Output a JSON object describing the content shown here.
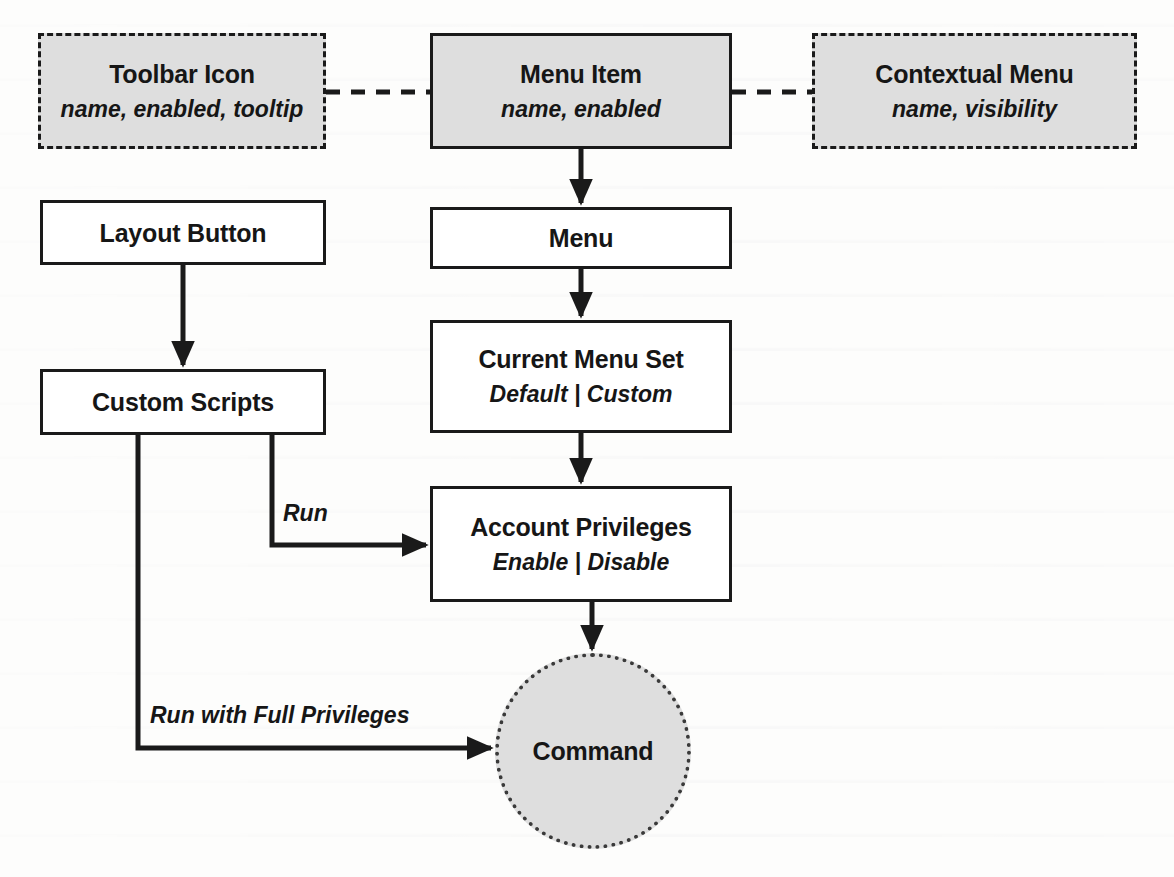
{
  "diagram": {
    "colors": {
      "ink": "#1a1a1a",
      "shaded_fill": "#dedede",
      "plain_fill": "#ffffff",
      "page": "#fdfdfc"
    },
    "nodes": [
      {
        "id": "toolbar-icon",
        "title": "Toolbar Icon",
        "sub": "name, enabled, tooltip",
        "shape": "rect",
        "border": "dashed",
        "fill": "shaded",
        "x": 38,
        "y": 33,
        "w": 288,
        "h": 116
      },
      {
        "id": "menu-item",
        "title": "Menu Item",
        "sub": "name, enabled",
        "shape": "rect",
        "border": "solid",
        "fill": "shaded",
        "x": 430,
        "y": 33,
        "w": 302,
        "h": 116
      },
      {
        "id": "contextual-menu",
        "title": "Contextual Menu",
        "sub": "name, visibility",
        "shape": "rect",
        "border": "dashed",
        "fill": "shaded",
        "x": 812,
        "y": 33,
        "w": 325,
        "h": 116
      },
      {
        "id": "layout-button",
        "title": "Layout Button",
        "sub": "",
        "shape": "rect",
        "border": "solid",
        "fill": "plain",
        "x": 40,
        "y": 200,
        "w": 286,
        "h": 65
      },
      {
        "id": "menu",
        "title": "Menu",
        "sub": "",
        "shape": "rect",
        "border": "solid",
        "fill": "plain",
        "x": 430,
        "y": 207,
        "w": 302,
        "h": 62
      },
      {
        "id": "custom-scripts",
        "title": "Custom Scripts",
        "sub": "",
        "shape": "rect",
        "border": "solid",
        "fill": "plain",
        "x": 40,
        "y": 369,
        "w": 286,
        "h": 66
      },
      {
        "id": "current-menu-set",
        "title": "Current Menu Set",
        "sub": "Default | Custom",
        "shape": "rect",
        "border": "solid",
        "fill": "plain",
        "x": 430,
        "y": 320,
        "w": 302,
        "h": 113
      },
      {
        "id": "account-privileges",
        "title": "Account Privileges",
        "sub": "Enable | Disable",
        "shape": "rect",
        "border": "solid",
        "fill": "plain",
        "x": 430,
        "y": 486,
        "w": 302,
        "h": 116
      },
      {
        "id": "command",
        "title": "Command",
        "sub": "",
        "shape": "circle",
        "border": "dotted",
        "fill": "shaded",
        "x": 495,
        "y": 653,
        "w": 196,
        "h": 196
      }
    ],
    "edges": [
      {
        "id": "toolbar-icon-to-menu-item",
        "from": "toolbar-icon",
        "to": "menu-item",
        "style": "dashed",
        "arrow": "none",
        "label": ""
      },
      {
        "id": "menu-item-to-contextual-menu",
        "from": "menu-item",
        "to": "contextual-menu",
        "style": "dashed",
        "arrow": "none",
        "label": ""
      },
      {
        "id": "menu-item-to-menu",
        "from": "menu-item",
        "to": "menu",
        "style": "solid",
        "arrow": "end",
        "label": ""
      },
      {
        "id": "menu-to-current-menu-set",
        "from": "menu",
        "to": "current-menu-set",
        "style": "solid",
        "arrow": "end",
        "label": ""
      },
      {
        "id": "current-menu-set-to-account-privileges",
        "from": "current-menu-set",
        "to": "account-privileges",
        "style": "solid",
        "arrow": "end",
        "label": ""
      },
      {
        "id": "layout-button-to-custom-scripts",
        "from": "layout-button",
        "to": "custom-scripts",
        "style": "solid",
        "arrow": "end",
        "label": ""
      },
      {
        "id": "custom-scripts-to-account-privileges",
        "from": "custom-scripts",
        "to": "account-privileges",
        "style": "solid",
        "arrow": "end",
        "label": "Run"
      },
      {
        "id": "custom-scripts-to-command",
        "from": "custom-scripts",
        "to": "command",
        "style": "solid",
        "arrow": "end",
        "label": "Run with Full Privileges"
      },
      {
        "id": "account-privileges-to-command",
        "from": "account-privileges",
        "to": "command",
        "style": "solid",
        "arrow": "end",
        "label": ""
      }
    ],
    "edge_labels": {
      "run": "Run",
      "run_with_full_privileges": "Run with Full Privileges"
    }
  }
}
